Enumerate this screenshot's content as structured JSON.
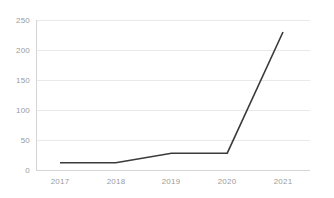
{
  "chart_data": {
    "type": "line",
    "title": "",
    "subtitle": "",
    "xlabel": "",
    "ylabel": "",
    "categories": [
      "2017",
      "2018",
      "2019",
      "2020",
      "2021"
    ],
    "values": [
      12,
      12,
      28,
      28,
      230
    ],
    "series": [
      {
        "name": "",
        "values": [
          12,
          12,
          28,
          28,
          230
        ]
      }
    ],
    "ylim": [
      0,
      250
    ],
    "y_ticks": [
      0,
      50,
      100,
      150,
      200,
      250
    ],
    "y_tick_labels": [
      "0",
      "50",
      "100",
      "150",
      "200",
      "250"
    ],
    "x_tick_labels": [
      "2017",
      "2018",
      "2019",
      "2020",
      "2021"
    ],
    "grid": {
      "horizontal": true,
      "vertical": false
    },
    "legend": {
      "visible": false,
      "position": "none"
    },
    "annotations": [],
    "colors": {
      "line": "#3a3a3a",
      "gridline": "#e9e9e9",
      "axis": "#d5d5d5",
      "tick_text": "#9b9b9b",
      "background": "#ffffff"
    }
  }
}
